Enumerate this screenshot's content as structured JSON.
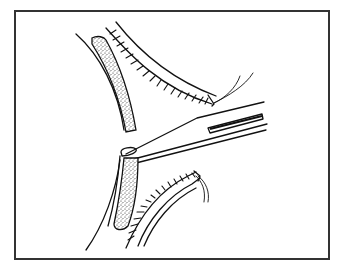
{
  "figure": {
    "type": "line-illustration",
    "colors": {
      "line": "#111111",
      "frame": "#333333",
      "background": "#ffffff"
    },
    "elements": [
      "upper-stippled-tissue-band",
      "upper-hatched-tissue-band",
      "lower-stippled-tissue-band",
      "lower-hatched-tissue-band",
      "forceps",
      "sutures"
    ]
  }
}
